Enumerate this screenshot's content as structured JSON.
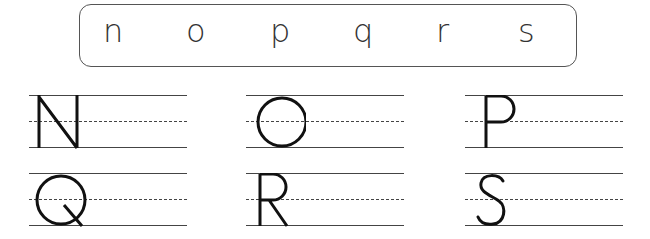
{
  "letter_bank": {
    "letters": [
      "n",
      "o",
      "p",
      "q",
      "r",
      "s"
    ]
  },
  "practice_rows": [
    {
      "letters": [
        "N",
        "O",
        "P"
      ]
    },
    {
      "letters": [
        "Q",
        "R",
        "S"
      ]
    }
  ],
  "colors": {
    "ink": "#111111",
    "lines": "#444444",
    "border": "#555555"
  }
}
